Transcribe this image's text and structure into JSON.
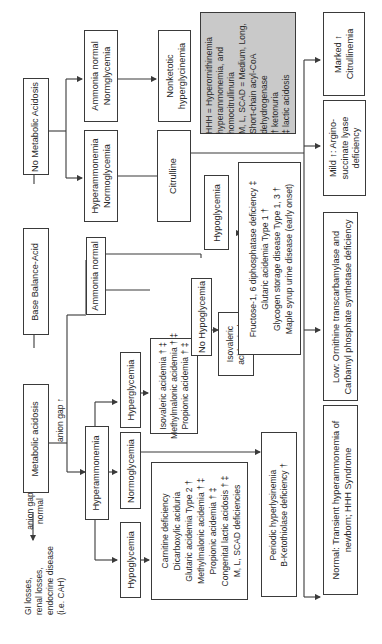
{
  "diagram": {
    "root": {
      "label": "Base Balance-Acid"
    },
    "no_metabolic_acidosis": {
      "label": "No Metabolic Acidosis"
    },
    "metabolic_acidosis": {
      "label": "Metabolic acidosis"
    },
    "anion_gap_normal_edge": {
      "lines": [
        "anion gap",
        "normal"
      ]
    },
    "anion_gap_normal_result": {
      "lines": [
        "GI losses,",
        "renal losses,",
        "endocrine disease",
        "(i.e. CAH)"
      ]
    },
    "anion_gap_high_edge": {
      "label": "anion gap ↑"
    },
    "hyperammonemia": {
      "label": "Hyperammonemia"
    },
    "ammonia_normal": {
      "label": "Ammonia normal"
    },
    "ha_hypoglycemia": {
      "label": "Hypoglycemia"
    },
    "ha_normoglycemia": {
      "label": "Normoglycemia"
    },
    "ha_hyperglycemia": {
      "label": "Hyperglycemia"
    },
    "hypoglycemia_list": {
      "lines": [
        "Carnitine deficiency",
        "Dicarboxylic aciduria",
        "Glutaric acidemia Type 2 †",
        "Methylmalonic acidemia † ‡",
        "Propionic acidemia † ‡",
        "Congenital lactic acidosis † ‡",
        "M, L, SCAD deficiencies"
      ]
    },
    "hyperglycemia_list": {
      "lines": [
        "Isovaleric acidemia † ‡",
        "Methylmalonic acidemia † ‡",
        "Propionic acidemia † ‡"
      ]
    },
    "normoglycemia_list": {
      "lines": [
        "Periodic hyperlysinemia",
        "B-Ketothiolase deficiency †"
      ]
    },
    "an_no_hypoglycemia": {
      "label": "No Hypoglycemia"
    },
    "an_hypoglycemia": {
      "label": "Hypoglycemia"
    },
    "isovaleric": {
      "lines": [
        "Isovaleric",
        "acidemia ‡"
      ]
    },
    "an_hypoglycemia_list": {
      "lines": [
        "Fructose-1, 6 diphosphatase deficiency ‡",
        "Glutaric acidemia Type 1 †",
        "Glycogen storage disease Type 1, 3 †",
        "Maple syrup urine disease (early onset)"
      ]
    },
    "nma_ammonia_normal": {
      "lines": [
        "Ammonia normal",
        "Normglycemia"
      ]
    },
    "nma_hyperammonemia": {
      "lines": [
        "Hyperammonemia",
        "Normoglycemia"
      ]
    },
    "nonketotic": {
      "lines": [
        "Nonketotic",
        "hyperglycinemia"
      ]
    },
    "citrulline": {
      "label": "Citrulline"
    },
    "marked_citrullinemia": {
      "lines": [
        "Marked ↑",
        "Citrullinemia"
      ]
    },
    "mild_asl": {
      "lines": [
        "Mild ↑: Argino-",
        "succinate lyase",
        "deficiency"
      ]
    },
    "low_otc": {
      "lines": [
        "Low: Ornithine transcarbamylase and",
        "Carbamyl phosphate synthetase deficiency"
      ]
    },
    "normal_transient": {
      "lines": [
        "Normal: Transient hyperammonemia of",
        "newborn; HHH Syndrome"
      ]
    },
    "legend": {
      "lines": [
        "HHH = Hyperornithinemia",
        "hyperammonemia, and",
        "homocitrullinuria",
        "M, L, SCAD = Medium, Long,",
        "Short-chain acyl-CoA",
        "dehydrogenase",
        "† ketonuria",
        "‡ lactic acidosis"
      ],
      "bg_color": "#c9c9c9"
    },
    "colors": {
      "line": "#3a3a3a",
      "text": "#2a2a2a",
      "background": "#ffffff"
    }
  }
}
